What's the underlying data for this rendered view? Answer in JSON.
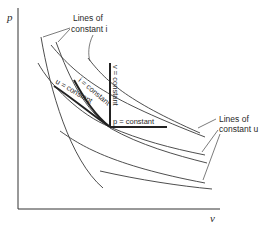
{
  "diagram": {
    "axes": {
      "y_label": "p",
      "x_label": "v"
    },
    "annotations": {
      "constant_i_group": {
        "line1": "Lines of",
        "line2": "constant i"
      },
      "constant_u_group": {
        "line1": "Lines of",
        "line2": "constant u"
      }
    },
    "curve_labels": {
      "v_constant": "v = constant",
      "i_constant": "i = constant",
      "u_constant": "u = constant",
      "p_constant": "p = constant"
    },
    "colors": {
      "line": "#333333",
      "background": "#ffffff"
    }
  }
}
